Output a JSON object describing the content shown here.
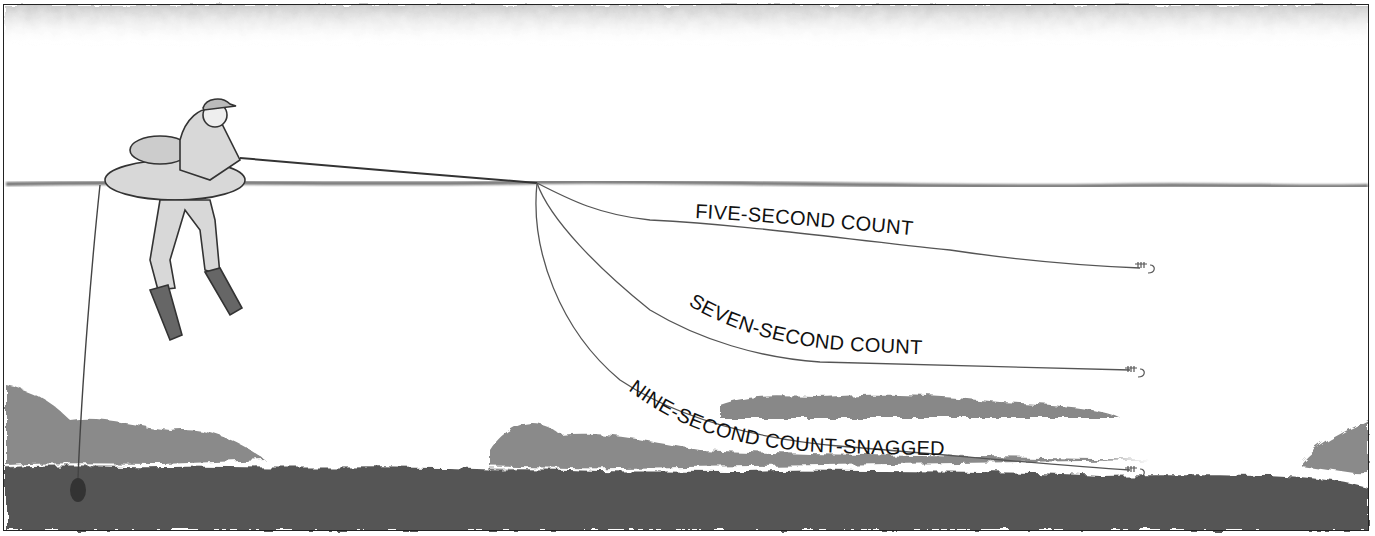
{
  "illustration": {
    "subject": "Float-tube angler counting down a sinking line",
    "labels": [
      {
        "id": "five",
        "text": "FIVE-SECOND COUNT"
      },
      {
        "id": "seven",
        "text": "SEVEN-SECOND COUNT"
      },
      {
        "id": "nine",
        "text": "NINE-SECOND COUNT-SNAGGED"
      }
    ],
    "colors": {
      "ink": "#222222",
      "weed": "#7a7a7a",
      "weed_dark": "#4a4a4a",
      "background": "#ffffff"
    }
  }
}
